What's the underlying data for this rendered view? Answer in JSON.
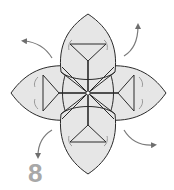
{
  "diagram": {
    "type": "origami-instruction-step",
    "step_number": "8",
    "colors": {
      "paper_fill": "#e6e6e6",
      "outline": "#2a2a2a",
      "arrow": "#7a7a7a",
      "step_number": "#a8a8a8",
      "background": "#ffffff"
    },
    "petals": [
      {
        "position": "top"
      },
      {
        "position": "right"
      },
      {
        "position": "bottom"
      },
      {
        "position": "left"
      }
    ],
    "arrows": [
      {
        "position": "top-left",
        "direction": "outward"
      },
      {
        "position": "top-right",
        "direction": "outward"
      },
      {
        "position": "bottom-left",
        "direction": "outward"
      },
      {
        "position": "bottom-right",
        "direction": "outward"
      }
    ]
  }
}
